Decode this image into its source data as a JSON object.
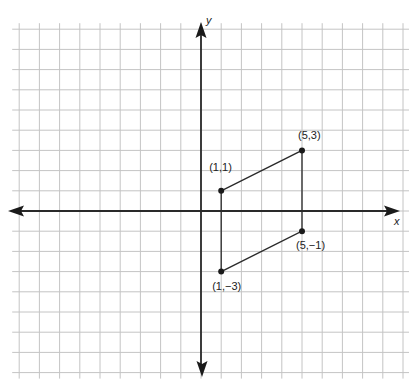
{
  "diagram": {
    "type": "coordinate-plane",
    "axes": {
      "x_label": "x",
      "y_label": "y",
      "unit_px": 20.2,
      "origin_px": [
        201,
        211
      ],
      "x_range": [
        -9,
        10
      ],
      "y_range": [
        -8,
        9
      ]
    },
    "shape": {
      "name": "parallelogram",
      "vertices": [
        {
          "x": 1,
          "y": 1,
          "label": "(1,1)"
        },
        {
          "x": 5,
          "y": 3,
          "label": "(5,3)"
        },
        {
          "x": 5,
          "y": -1,
          "label": "(5,−1)"
        },
        {
          "x": 1,
          "y": -3,
          "label": "(1,−3)"
        }
      ]
    },
    "colors": {
      "grid": "#c4c4c4",
      "axis": "#2a2a2a",
      "shape": "#2a2a2a",
      "background": "#ffffff"
    }
  }
}
